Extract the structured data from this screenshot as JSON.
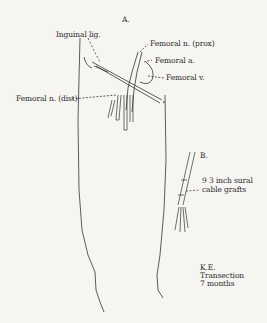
{
  "figure": {
    "panel_a_label": "A.",
    "panel_b_label": "B.",
    "labels": {
      "inguinal_lig": "Inguinal lig.",
      "femoral_n_prox": "Femoral n. (prox)",
      "femoral_a": "Femoral a.",
      "femoral_v": "Femoral v.",
      "femoral_n_dist": "Femoral n. (dist)",
      "grafts_line1": "9 3 inch sural",
      "grafts_line2": "cable grafts",
      "case_initials": "K.E.",
      "case_line2": "Transection",
      "case_line3": "7 months"
    }
  }
}
